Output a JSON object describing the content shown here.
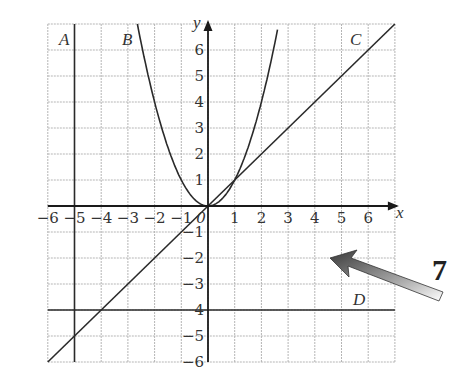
{
  "chart_data": {
    "type": "line",
    "title": "",
    "xlabel": "x",
    "ylabel": "y",
    "xlim": [
      -6,
      7
    ],
    "ylim": [
      -6,
      7
    ],
    "grid": true,
    "x_ticks": [
      -6,
      -5,
      -4,
      -3,
      -2,
      -1,
      0,
      1,
      2,
      3,
      4,
      5,
      6
    ],
    "y_ticks": [
      -6,
      -5,
      -4,
      -3,
      -2,
      -1,
      1,
      2,
      3,
      4,
      5,
      6
    ],
    "x_tick_labels": [
      "−6",
      "−5",
      "−4",
      "−3",
      "−2",
      "−1",
      "0",
      "1",
      "2",
      "3",
      "4",
      "5",
      "6"
    ],
    "y_tick_labels": [
      "−6",
      "−5",
      "4",
      "−3",
      "−2",
      "−1",
      "1",
      "2",
      "3",
      "4",
      "5",
      "6"
    ],
    "series": [
      {
        "name": "A",
        "kind": "vertical",
        "equation": "x = -5"
      },
      {
        "name": "B",
        "kind": "parabola",
        "equation": "y = x^2",
        "x": [
          -2.6,
          -2,
          -1,
          0,
          1,
          2,
          2.6
        ],
        "y": [
          6.76,
          4,
          1,
          0,
          1,
          4,
          6.76
        ]
      },
      {
        "name": "C",
        "kind": "line",
        "equation": "y = x",
        "x": [
          -6,
          0,
          7
        ],
        "y": [
          -6,
          0,
          7
        ]
      },
      {
        "name": "D",
        "kind": "horizontal",
        "equation": "y = -4"
      }
    ],
    "annotations": [
      {
        "text": "A",
        "x": -5.5,
        "y": 6.4
      },
      {
        "text": "B",
        "x": -3.0,
        "y": 6.4
      },
      {
        "text": "C",
        "x": 5.6,
        "y": 6.4
      },
      {
        "text": "D",
        "x": 5.6,
        "y": -3.5
      },
      {
        "text": "7",
        "type": "question-number",
        "with_arrow": true
      }
    ]
  },
  "labels": {
    "x_axis": "x",
    "y_axis": "y",
    "line_a": "A",
    "curve_b": "B",
    "line_c": "C",
    "line_d": "D",
    "question_number": "7"
  },
  "colors": {
    "grid": "#b5b5b5",
    "axis": "#1a1a1a",
    "lines": "#2a2a2a",
    "arrow_dark": "#4a4a4a",
    "arrow_light": "#ffffff"
  }
}
